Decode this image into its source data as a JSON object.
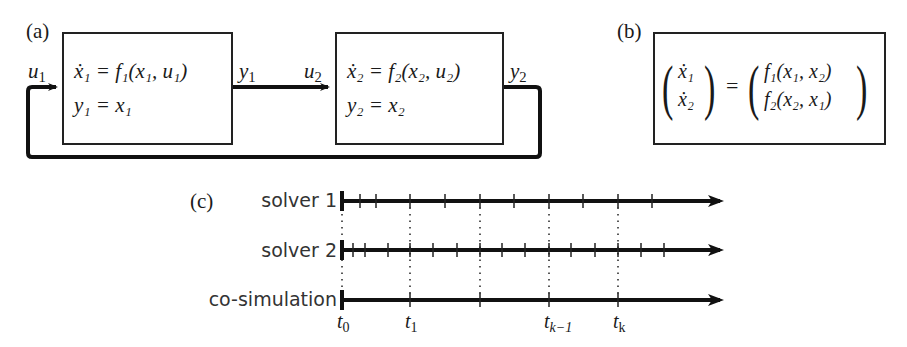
{
  "panel_a": {
    "label": "(a)",
    "block1": {
      "eq1_lhs": "x",
      "eq1_sub": "1",
      "eq1_rhs_f": "f",
      "eq1_rhs_fsub": "1",
      "eq1_args": "(x₁, u₁)",
      "eq2": "y₁ = x₁",
      "eq1_text": "ẋ₁ = f₁(x₁, u₁)"
    },
    "block2": {
      "eq1_text": "ẋ₂ = f₂(x₂, u₂)",
      "eq2": "y₂ = x₂"
    },
    "signals": {
      "u1": "u",
      "u1_sub": "1",
      "y1": "y",
      "y1_sub": "1",
      "u2": "u",
      "u2_sub": "2",
      "y2": "y",
      "y2_sub": "2"
    }
  },
  "panel_b": {
    "label": "(b)",
    "lhs": [
      "ẋ₁",
      "ẋ₂"
    ],
    "equals": "=",
    "rhs": [
      "f₁(x₁, x₂)",
      "f₂(x₂, x₁)"
    ]
  },
  "panel_c": {
    "label": "(c)",
    "rows": [
      {
        "name": "solver 1",
        "ticks_px": [
          360,
          376,
          410,
          445,
          480,
          514,
          549,
          583,
          618,
          652
        ]
      },
      {
        "name": "solver 2",
        "ticks_px": [
          353,
          365,
          388,
          410,
          433,
          457,
          480,
          502,
          525,
          549,
          571,
          595,
          618,
          641,
          664
        ]
      },
      {
        "name": "co-simulation",
        "ticks_px": [
          410,
          480,
          549,
          618
        ]
      }
    ],
    "sync_points_px": [
      410,
      480,
      549,
      618
    ],
    "time_labels": [
      {
        "t": "t",
        "sub": "0",
        "x": 342
      },
      {
        "t": "t",
        "sub": "1",
        "x": 410
      },
      {
        "t": "t",
        "sub": "k−1",
        "x": 549
      },
      {
        "t": "t",
        "sub": "k",
        "x": 618
      }
    ]
  }
}
